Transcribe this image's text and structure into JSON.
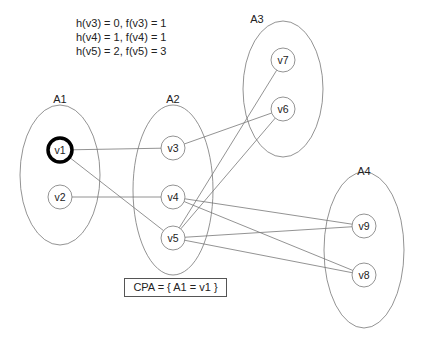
{
  "heuristics": [
    "h(v3) = 0, f(v3) = 1",
    "h(v4) = 1, f(v4) = 1",
    "h(v5) = 2, f(v5) = 3"
  ],
  "cpa_label": "CPA = { A1 = v1 }",
  "colors": {
    "stroke": "#777777",
    "text": "#222222",
    "highlight": "#000000"
  },
  "groups": [
    {
      "id": "A1",
      "label": "A1",
      "cx": 60,
      "cy": 175,
      "rx": 40,
      "ry": 70,
      "lx": 60,
      "ly": 103
    },
    {
      "id": "A2",
      "label": "A2",
      "cx": 173,
      "cy": 190,
      "rx": 40,
      "ry": 85,
      "lx": 173,
      "ly": 103
    },
    {
      "id": "A3",
      "label": "A3",
      "cx": 283,
      "cy": 89,
      "rx": 40,
      "ry": 68,
      "lx": 257,
      "ly": 23
    },
    {
      "id": "A4",
      "label": "A4",
      "cx": 364,
      "cy": 250,
      "rx": 40,
      "ry": 78,
      "lx": 364,
      "ly": 175
    }
  ],
  "nodes": [
    {
      "id": "v1",
      "label": "v1",
      "x": 60,
      "y": 150,
      "selected": true
    },
    {
      "id": "v2",
      "label": "v2",
      "x": 60,
      "y": 197,
      "selected": false
    },
    {
      "id": "v3",
      "label": "v3",
      "x": 173,
      "y": 148,
      "selected": false
    },
    {
      "id": "v4",
      "label": "v4",
      "x": 173,
      "y": 197,
      "selected": false
    },
    {
      "id": "v5",
      "label": "v5",
      "x": 173,
      "y": 238,
      "selected": false
    },
    {
      "id": "v7",
      "label": "v7",
      "x": 283,
      "y": 60,
      "selected": false
    },
    {
      "id": "v6",
      "label": "v6",
      "x": 283,
      "y": 109,
      "selected": false
    },
    {
      "id": "v9",
      "label": "v9",
      "x": 364,
      "y": 226,
      "selected": false
    },
    {
      "id": "v8",
      "label": "v8",
      "x": 364,
      "y": 275,
      "selected": false
    }
  ],
  "edges": [
    [
      "v1",
      "v3"
    ],
    [
      "v1",
      "v5"
    ],
    [
      "v2",
      "v4"
    ],
    [
      "v3",
      "v6"
    ],
    [
      "v5",
      "v6"
    ],
    [
      "v5",
      "v7"
    ],
    [
      "v4",
      "v9"
    ],
    [
      "v4",
      "v8"
    ],
    [
      "v5",
      "v9"
    ],
    [
      "v5",
      "v8"
    ]
  ]
}
